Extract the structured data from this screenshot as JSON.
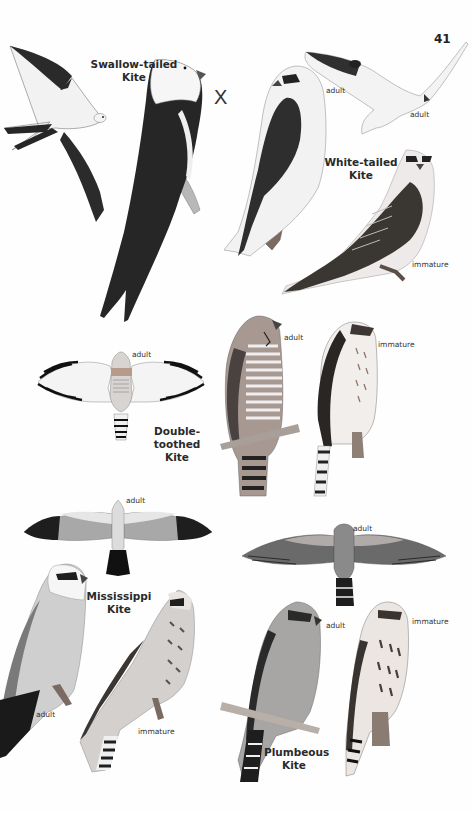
{
  "page": {
    "number": "41",
    "mark": "X"
  },
  "species": [
    {
      "name_line1": "Swallow-tailed",
      "name_line2": "Kite",
      "labels": []
    },
    {
      "name_line1": "White-tailed",
      "name_line2": "Kite",
      "labels": [
        "adult",
        "adult",
        "immature"
      ]
    },
    {
      "name_line1": "Double-toothed",
      "name_line2": "Kite",
      "labels": [
        "adult",
        "adult",
        "immature"
      ]
    },
    {
      "name_line1": "Mississippi",
      "name_line2": "Kite",
      "labels": [
        "adult",
        "adult",
        "immature"
      ]
    },
    {
      "name_line1": "Plumbeous",
      "name_line2": "Kite",
      "labels": [
        "adult",
        "adult",
        "immature"
      ]
    }
  ],
  "colors": {
    "ink": "#1e1e1e",
    "dark_gray": "#3a3a3a",
    "mid_gray": "#8a8a8a",
    "light_gray": "#d0d0d0",
    "paper": "#fefefe"
  }
}
